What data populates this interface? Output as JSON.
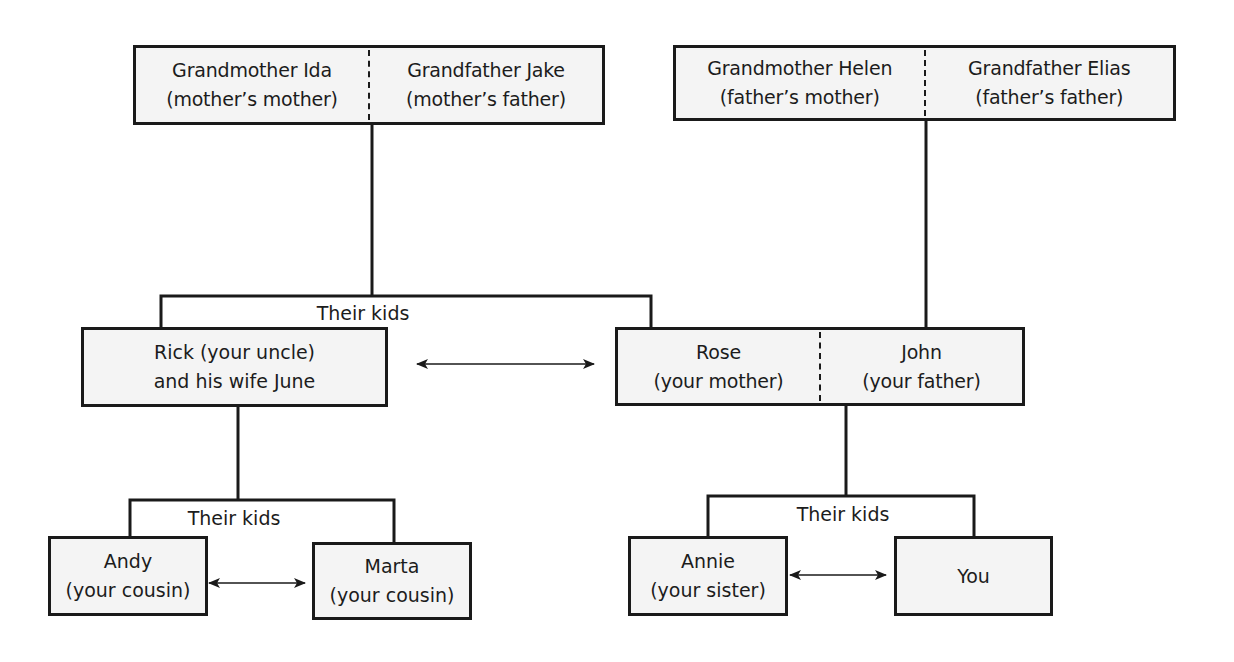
{
  "diagram": {
    "title": "",
    "colors": {
      "line": "#1a1a1a",
      "box_fill": "#f4f4f4",
      "text": "#1c1c1c"
    },
    "nodes": {
      "maternal_grandparents": {
        "left": {
          "name": "Grandmother Ida",
          "relation": "(mother’s mother)"
        },
        "right": {
          "name": "Grandfather Jake",
          "relation": "(mother’s father)"
        }
      },
      "paternal_grandparents": {
        "left": {
          "name": "Grandmother Helen",
          "relation": "(father’s mother)"
        },
        "right": {
          "name": "Grandfather Elias",
          "relation": "(father’s father)"
        }
      },
      "uncle": {
        "line1": "Rick (your uncle)",
        "line2": "and his wife June"
      },
      "parents": {
        "left": {
          "name": "Rose",
          "relation": "(your mother)"
        },
        "right": {
          "name": "John",
          "relation": "(your father)"
        }
      },
      "cousin_andy": {
        "name": "Andy",
        "relation": "(your cousin)"
      },
      "cousin_marta": {
        "name": "Marta",
        "relation": "(your cousin)"
      },
      "sister_annie": {
        "name": "Annie",
        "relation": "(your sister)"
      },
      "you": {
        "name": "You"
      }
    },
    "labels": {
      "grandparents_kids": "Their kids",
      "uncle_kids": "Their kids",
      "parents_kids": "Their kids"
    },
    "edges": [
      {
        "from": "maternal_grandparents",
        "to": [
          "uncle",
          "parents"
        ],
        "type": "parent-child",
        "label": "Their kids"
      },
      {
        "from": "paternal_grandparents",
        "to": [
          "parents"
        ],
        "type": "parent-child"
      },
      {
        "from": "uncle",
        "to": [
          "cousin_andy",
          "cousin_marta"
        ],
        "type": "parent-child",
        "label": "Their kids"
      },
      {
        "from": "parents",
        "to": [
          "sister_annie",
          "you"
        ],
        "type": "parent-child",
        "label": "Their kids"
      },
      {
        "from": "uncle",
        "to": "parents",
        "type": "sibling",
        "arrow": "both"
      },
      {
        "from": "cousin_andy",
        "to": "cousin_marta",
        "type": "sibling",
        "arrow": "both"
      },
      {
        "from": "sister_annie",
        "to": "you",
        "type": "sibling",
        "arrow": "both"
      }
    ]
  }
}
